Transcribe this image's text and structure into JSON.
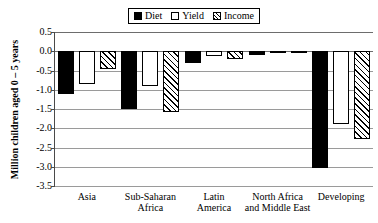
{
  "chart_data": {
    "type": "bar",
    "title": "",
    "xlabel": "",
    "ylabel": "Million children aged 0 – 5 years",
    "ylim": [
      -3.5,
      0.5
    ],
    "yticks": [
      "0.5",
      "0.0",
      "-0.5",
      "-1.0",
      "-1.5",
      "-2.0",
      "-2.5",
      "-3.0",
      "-3.5"
    ],
    "ytick_values": [
      0.5,
      0.0,
      -0.5,
      -1.0,
      -1.5,
      -2.0,
      -2.5,
      -3.0,
      -3.5
    ],
    "grid": true,
    "legend_position": "top-center",
    "categories": [
      "Asia",
      "Sub-Saharan Africa",
      "Latin America",
      "North Africa and Middle East",
      "Developing"
    ],
    "category_lines": [
      [
        "Asia"
      ],
      [
        "Sub-Saharan",
        "Africa"
      ],
      [
        "Latin",
        "America"
      ],
      [
        "North Africa",
        "and Middle East"
      ],
      [
        "Developing"
      ]
    ],
    "series": [
      {
        "name": "Diet",
        "fill": "solid",
        "color": "#000000",
        "values": [
          -1.1,
          -1.5,
          -0.3,
          -0.1,
          -3.03
        ]
      },
      {
        "name": "Yield",
        "fill": "empty",
        "color": "#ffffff",
        "values": [
          -0.85,
          -0.9,
          -0.12,
          -0.03,
          -1.88
        ]
      },
      {
        "name": "Income",
        "fill": "hatched",
        "color": "#ffffff",
        "values": [
          -0.47,
          -1.57,
          -0.2,
          -0.03,
          -2.28
        ]
      }
    ]
  },
  "legend": {
    "entries": [
      {
        "label": "Diet",
        "swatch": "diet-swatch-icon"
      },
      {
        "label": "Yield",
        "swatch": "yield-swatch-icon"
      },
      {
        "label": "Income",
        "swatch": "income-swatch-icon"
      }
    ]
  }
}
